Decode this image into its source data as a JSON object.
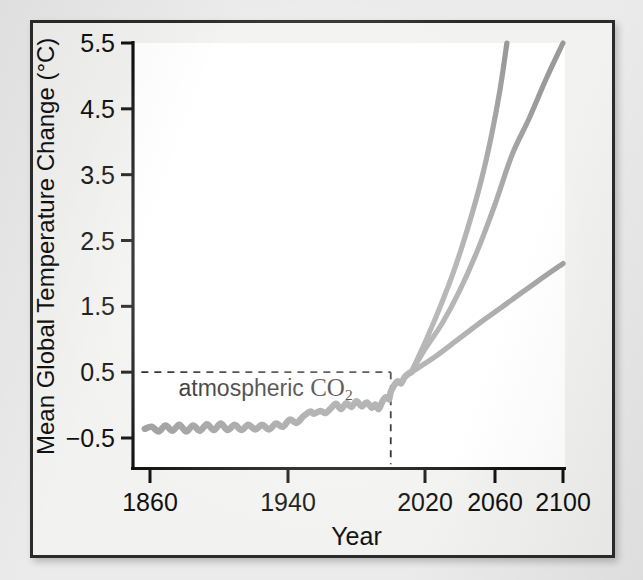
{
  "figure": {
    "background_color": "#ebebeb",
    "frame_color": "#2b2b2b",
    "plot_background_color": "#ffffff"
  },
  "chart_data": {
    "type": "line",
    "title": "",
    "xlabel": "Year",
    "ylabel": "Mean Global Temperature Change (°C)",
    "xlim": [
      1855,
      2100
    ],
    "ylim": [
      -0.9,
      5.5
    ],
    "grid": false,
    "legend": false,
    "line_color": "#9a9a9a",
    "annotation_color": "#161616",
    "xtick_labels": [
      "1860",
      "1940",
      "2020",
      "2060",
      "2100"
    ],
    "xtick_values": [
      1860,
      1940,
      2020,
      2060,
      2100
    ],
    "ytick_labels": [
      "5.5",
      "4.5",
      "3.5",
      "2.5",
      "1.5",
      "0.5",
      "−0.5"
    ],
    "ytick_values": [
      5.5,
      4.5,
      3.5,
      2.5,
      1.5,
      0.5,
      -0.5
    ],
    "annotations": [
      {
        "text": "atmospheric CO2",
        "display_prefix": "atmospheric ",
        "display_formula": "CO",
        "display_subscript": "2",
        "x": 1880,
        "y": 0.2
      }
    ],
    "reference_lines": [
      {
        "orientation": "horizontal",
        "value": 0.5,
        "style": "dashed",
        "from_x": 1855,
        "to_x": 2000
      },
      {
        "orientation": "vertical",
        "value": 2000,
        "style": "dashed",
        "from_y": -0.9,
        "to_y": 0.5
      }
    ],
    "series": [
      {
        "name": "historical-observed",
        "style": "solid",
        "points": [
          [
            1857,
            -0.36
          ],
          [
            1861,
            -0.33
          ],
          [
            1865,
            -0.4
          ],
          [
            1869,
            -0.31
          ],
          [
            1873,
            -0.39
          ],
          [
            1877,
            -0.3
          ],
          [
            1881,
            -0.4
          ],
          [
            1885,
            -0.31
          ],
          [
            1889,
            -0.39
          ],
          [
            1893,
            -0.29
          ],
          [
            1897,
            -0.38
          ],
          [
            1901,
            -0.28
          ],
          [
            1905,
            -0.38
          ],
          [
            1909,
            -0.3
          ],
          [
            1913,
            -0.38
          ],
          [
            1917,
            -0.3
          ],
          [
            1921,
            -0.37
          ],
          [
            1925,
            -0.3
          ],
          [
            1929,
            -0.37
          ],
          [
            1933,
            -0.28
          ],
          [
            1937,
            -0.33
          ],
          [
            1941,
            -0.22
          ],
          [
            1945,
            -0.27
          ],
          [
            1949,
            -0.17
          ],
          [
            1953,
            -0.1
          ],
          [
            1955,
            -0.13
          ],
          [
            1959,
            -0.09
          ],
          [
            1962,
            -0.12
          ],
          [
            1965,
            -0.05
          ],
          [
            1968,
            0.02
          ],
          [
            1971,
            -0.06
          ],
          [
            1974,
            0.03
          ],
          [
            1977,
            -0.03
          ],
          [
            1980,
            0.06
          ],
          [
            1983,
            -0.02
          ],
          [
            1986,
            0.04
          ],
          [
            1989,
            -0.04
          ],
          [
            1991,
            0.01
          ],
          [
            1993,
            -0.06
          ],
          [
            1995,
            0.05
          ],
          [
            1997,
            0.12
          ],
          [
            1999,
            0.09
          ],
          [
            2000,
            0.2
          ],
          [
            2002,
            0.3
          ],
          [
            2004,
            0.36
          ],
          [
            2006,
            0.33
          ],
          [
            2008,
            0.42
          ],
          [
            2010,
            0.47
          ],
          [
            2012,
            0.5
          ]
        ]
      },
      {
        "name": "projection-high",
        "style": "solid",
        "points": [
          [
            2012,
            0.5
          ],
          [
            2020,
            0.95
          ],
          [
            2028,
            1.45
          ],
          [
            2036,
            2.0
          ],
          [
            2044,
            2.65
          ],
          [
            2052,
            3.4
          ],
          [
            2058,
            4.1
          ],
          [
            2063,
            4.8
          ],
          [
            2067,
            5.5
          ]
        ],
        "end_value": 5.5
      },
      {
        "name": "projection-medium",
        "style": "solid",
        "points": [
          [
            2012,
            0.5
          ],
          [
            2020,
            0.85
          ],
          [
            2030,
            1.25
          ],
          [
            2040,
            1.75
          ],
          [
            2050,
            2.35
          ],
          [
            2060,
            3.05
          ],
          [
            2070,
            3.8
          ],
          [
            2080,
            4.35
          ],
          [
            2090,
            4.95
          ],
          [
            2100,
            5.5
          ]
        ],
        "end_value": 5.5
      },
      {
        "name": "projection-low",
        "style": "solid",
        "points": [
          [
            2012,
            0.5
          ],
          [
            2025,
            0.72
          ],
          [
            2040,
            1.02
          ],
          [
            2055,
            1.32
          ],
          [
            2070,
            1.6
          ],
          [
            2085,
            1.88
          ],
          [
            2100,
            2.15
          ]
        ],
        "end_value": 2.15
      }
    ]
  }
}
